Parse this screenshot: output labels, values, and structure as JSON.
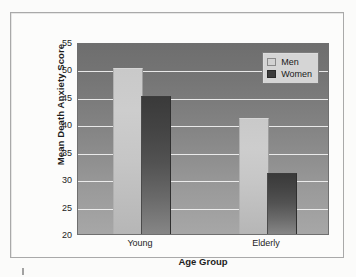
{
  "figure": {
    "background_color": "#fbfbfa",
    "frame_color": "#a9a9a9"
  },
  "legend": {
    "position": "top-right",
    "entries": [
      {
        "label": "Men",
        "color": "#d2d2d2"
      },
      {
        "label": "Women",
        "color": "#3c3c3c"
      }
    ]
  },
  "axes": {
    "y_title": "Mean Death Anxiety Score",
    "x_title": "Age Group",
    "y_ticks": [
      20,
      25,
      30,
      35,
      40,
      45,
      50,
      55
    ],
    "x_ticks": [
      "Young",
      "Elderly"
    ]
  },
  "chart_data": {
    "type": "bar",
    "title": "",
    "xlabel": "Age Group",
    "ylabel": "Mean Death Anxiety Score",
    "categories": [
      "Young",
      "Elderly"
    ],
    "series": [
      {
        "name": "Men",
        "values": [
          50,
          41
        ],
        "color": "#d2d2d2"
      },
      {
        "name": "Women",
        "values": [
          45,
          31
        ],
        "color": "#3c3c3c"
      }
    ],
    "ylim": [
      20,
      55
    ],
    "ytick_step": 5,
    "grid": true,
    "grid_color": "#f2f2f2",
    "legend_position": "top-right",
    "plot_background": "vertical-gray-gradient"
  }
}
